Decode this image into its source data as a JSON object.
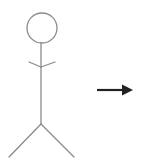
{
  "diagram": {
    "type": "uml-actor-with-arrow",
    "elements": [
      {
        "kind": "actor",
        "label": "",
        "description": "stick figure actor"
      },
      {
        "kind": "arrow",
        "direction": "right",
        "label": ""
      }
    ],
    "colors": {
      "actor_stroke": "#8a8a8a",
      "arrow": "#222222",
      "background": "#ffffff"
    }
  }
}
